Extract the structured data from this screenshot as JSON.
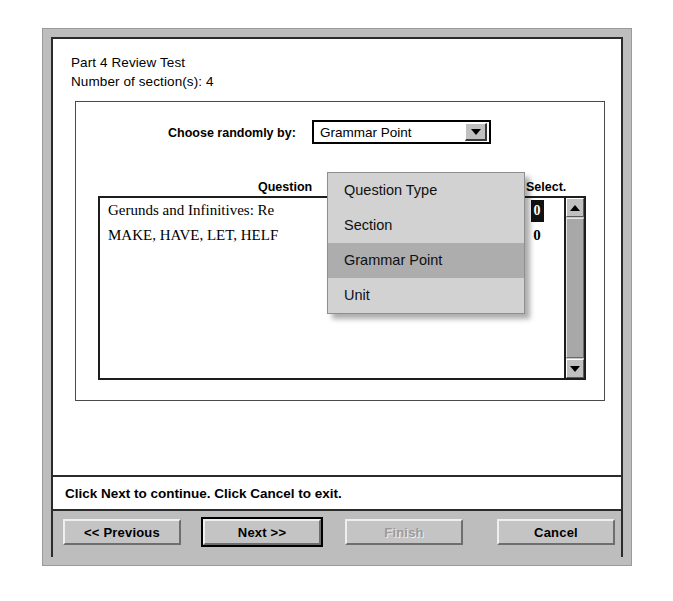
{
  "dialog": {
    "title_line_1": "Part 4 Review Test",
    "title_line_2": "Number of section(s): 4"
  },
  "group": {
    "combo_label": "Choose randomly by:",
    "combo_selected": "Grammar Point",
    "combo_arrow_icon": "chevron-down-icon",
    "dropdown_open": true,
    "dropdown_options": [
      "Question Type",
      "Section",
      "Grammar Point",
      "Unit"
    ],
    "dropdown_highlighted": "Grammar Point",
    "columns": {
      "question": "Question",
      "avail": "ail.",
      "select": "Select."
    },
    "rows": [
      {
        "question": "Gerunds and Infinitives: Re",
        "select": "0",
        "selected": true
      },
      {
        "question": "MAKE, HAVE, LET, HELF",
        "select": "0",
        "selected": false
      }
    ],
    "scrollbar": {
      "up_icon": "triangle-up-icon",
      "down_icon": "triangle-down-icon"
    }
  },
  "status": {
    "text": "Click Next to continue. Click Cancel to exit."
  },
  "buttons": {
    "previous": "<< Previous",
    "next": "Next >>",
    "finish": "Finish",
    "cancel": "Cancel"
  },
  "colors": {
    "dialog_face": "#bdbdbd",
    "client_bg": "#ffffff",
    "dropdown_bg": "#d2d2d2",
    "dropdown_highlight": "#adadad",
    "button_face": "#c4c4c4",
    "disabled_text": "#9b9b9b",
    "border_dark": "#2b2b2b"
  }
}
